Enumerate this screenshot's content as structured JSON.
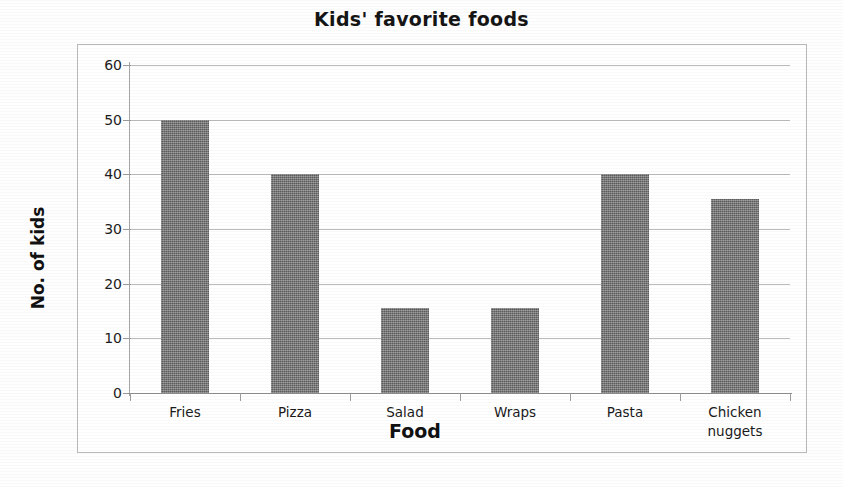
{
  "chart_data": {
    "type": "bar",
    "title": "Kids' favorite foods",
    "xlabel": "Food",
    "ylabel": "No. of kids",
    "categories": [
      "Fries",
      "Pizza",
      "Salad",
      "Wraps",
      "Pasta",
      "Chicken nuggets"
    ],
    "category_lines": [
      [
        "Fries"
      ],
      [
        "Pizza"
      ],
      [
        "Salad"
      ],
      [
        "Wraps"
      ],
      [
        "Pasta"
      ],
      [
        "Chicken",
        "nuggets"
      ]
    ],
    "values": [
      50,
      40,
      15.5,
      15.5,
      40,
      35.5
    ],
    "ylim": [
      0,
      60
    ],
    "yticks": [
      0,
      10,
      20,
      30,
      40,
      50,
      60
    ],
    "ytick_labels": [
      "0",
      "10",
      "20",
      "30",
      "40",
      "50",
      "60"
    ],
    "grid": true,
    "grid_axis": "y",
    "legend": false,
    "bar_color": "#6f6f6f",
    "gridline_color": "#bcbcbc",
    "axis_color": "#9a9a9a",
    "plot_border_color": "#b9b9b9",
    "background_color": "#ffffff"
  }
}
